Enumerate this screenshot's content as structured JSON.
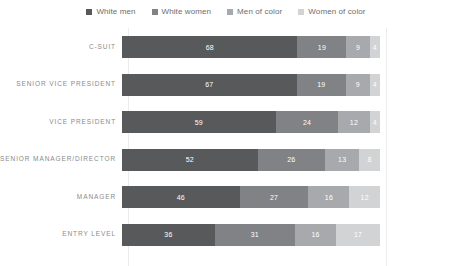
{
  "legend": {
    "position": "top-center",
    "items": [
      {
        "label": "White men",
        "color": "#58595b",
        "key": "white_men"
      },
      {
        "label": "White women",
        "color": "#808285",
        "key": "white_women"
      },
      {
        "label": "Men of color",
        "color": "#a7a9ac",
        "key": "men_of_color"
      },
      {
        "label": "Women of color",
        "color": "#d1d3d4",
        "key": "women_of_color"
      }
    ]
  },
  "chart_data": {
    "type": "bar",
    "orientation": "horizontal",
    "stacked": true,
    "stack_mode": "percent",
    "title": "",
    "subtitle": "",
    "xlabel": "",
    "ylabel": "",
    "xlim": [
      0,
      100
    ],
    "grid": true,
    "legend_position": "top-center",
    "categories": [
      "C-SUIT",
      "SENIOR VICE PRESIDENT",
      "VICE PRESIDENT",
      "SENIOR MANAGER/DIRECTOR",
      "MANAGER",
      "ENTRY LEVEL"
    ],
    "series": [
      {
        "name": "White men",
        "color": "#58595b",
        "values": [
          68,
          67,
          59,
          52,
          46,
          36
        ]
      },
      {
        "name": "White women",
        "color": "#808285",
        "values": [
          19,
          19,
          24,
          26,
          27,
          31
        ]
      },
      {
        "name": "Men of color",
        "color": "#a7a9ac",
        "values": [
          9,
          9,
          12,
          13,
          16,
          16
        ]
      },
      {
        "name": "Women of color",
        "color": "#d1d3d4",
        "values": [
          4,
          4,
          4,
          8,
          12,
          17
        ]
      }
    ],
    "rows": [
      {
        "category": "C-SUIT",
        "values": [
          68,
          19,
          9,
          4
        ]
      },
      {
        "category": "SENIOR VICE PRESIDENT",
        "values": [
          67,
          19,
          9,
          4
        ]
      },
      {
        "category": "VICE PRESIDENT",
        "values": [
          59,
          24,
          12,
          4
        ]
      },
      {
        "category": "SENIOR MANAGER/DIRECTOR",
        "values": [
          52,
          26,
          13,
          8
        ]
      },
      {
        "category": "MANAGER",
        "values": [
          46,
          27,
          16,
          12
        ]
      },
      {
        "category": "ENTRY LEVEL",
        "values": [
          36,
          31,
          16,
          17
        ]
      }
    ],
    "gridline_values": [
      0,
      100
    ]
  },
  "colors": {
    "background": "#ffffff",
    "gridline": "#ececed",
    "label_text": "#8a8a8a",
    "legend_text": "#6d6d6d",
    "value_text": "#ffffff"
  }
}
